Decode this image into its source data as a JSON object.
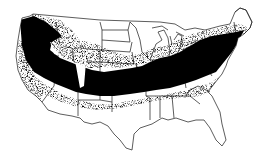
{
  "map": {
    "subject": "United States (contiguous)",
    "description": "Dot-density distribution map; dense black band across the northern/central states from the Pacific Northwest and California through the Great Plains and Midwest to the Northeast",
    "colors": {
      "background": "#ffffff",
      "dots": "#000000",
      "state_borders": "#333333"
    },
    "dense_regions": [
      "Pacific Northwest",
      "Northern California / Nevada",
      "Idaho / Utah / Colorado fringes",
      "Central Plains (Kansas, Nebraska, Missouri)",
      "Ohio Valley / Midwest",
      "Mid-Atlantic and New England"
    ],
    "sparse_regions": [
      "Southern California / Arizona / New Mexico",
      "Texas / Gulf Coast",
      "Southeast / Florida",
      "Northern Plains (Dakotas, Minnesota)",
      "Northern Maine",
      "Utah interior"
    ]
  }
}
